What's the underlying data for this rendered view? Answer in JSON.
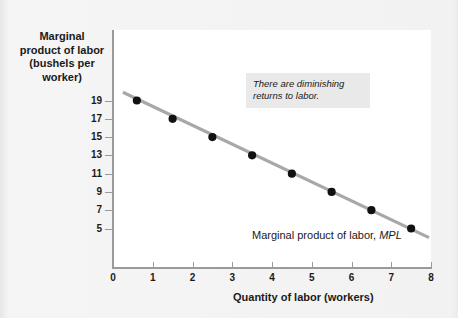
{
  "figure": {
    "y_axis_title": "Marginal\nproduct of labor\n(bushels per\nworker)",
    "x_axis_title": "Quantity of labor (workers)",
    "annotation": "There are diminishing\nreturns to labor.",
    "curve_label_text": "Marginal product of labor,",
    "curve_label_symbol": "MPL",
    "colors": {
      "line": "#a8a8a8",
      "point": "#111111",
      "axis": "#9a9a9a",
      "plot_background": "#ffffff",
      "page_background": "#f3f3f3",
      "annotation_background": "#e9e9e9",
      "text": "#1a1a1a"
    }
  },
  "chart_data": {
    "type": "line",
    "title": "",
    "subtitle": "",
    "xlabel": "Quantity of labor (workers)",
    "ylabel": "Marginal product of labor (bushels per worker)",
    "xlim": [
      0,
      8
    ],
    "ylim": [
      3,
      21
    ],
    "xticks": [
      0,
      1,
      2,
      3,
      4,
      5,
      6,
      7,
      8
    ],
    "xtick_labels": [
      "0",
      "1",
      "2",
      "3",
      "4",
      "5",
      "6",
      "7",
      "8"
    ],
    "yticks": [
      19,
      17,
      15,
      13,
      11,
      9,
      7,
      5
    ],
    "ytick_labels": [
      "19",
      "17",
      "15",
      "13",
      "11",
      "9",
      "7",
      "5"
    ],
    "grid": false,
    "legend": "none",
    "series": [
      {
        "name": "Marginal product of labor, MPL",
        "marker": "filled-circle",
        "line_style": "solid",
        "x": [
          0.6,
          1.5,
          2.5,
          3.5,
          4.5,
          5.5,
          6.5,
          7.5
        ],
        "values": [
          19,
          17,
          15,
          13,
          11,
          9,
          7,
          5
        ],
        "points": [
          {
            "x": 0.6,
            "y": 19
          },
          {
            "x": 1.5,
            "y": 17
          },
          {
            "x": 2.5,
            "y": 15
          },
          {
            "x": 3.5,
            "y": 13
          },
          {
            "x": 4.5,
            "y": 11
          },
          {
            "x": 5.5,
            "y": 9
          },
          {
            "x": 6.5,
            "y": 7
          },
          {
            "x": 7.5,
            "y": 5
          }
        ],
        "line_from": {
          "x": 0.25,
          "y": 19.9
        },
        "line_to": {
          "x": 7.95,
          "y": 4.0
        }
      }
    ],
    "annotations": [
      {
        "text": "There are diminishing returns to labor.",
        "style": "italic-grey-box"
      },
      {
        "text": "Marginal product of labor, MPL",
        "style": "curve-label"
      }
    ]
  }
}
